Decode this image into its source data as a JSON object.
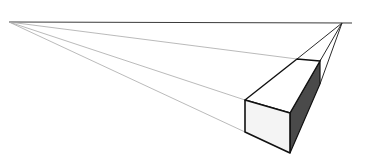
{
  "diagram": {
    "background": "#ffffff",
    "colors": {
      "horizon": "#3a3a3a",
      "guide_light": "#a8a8a8",
      "guide_dark": "#2a2a2a",
      "edge": "#111111",
      "front_face": "#f4f4f4",
      "top_face": "#ffffff",
      "side_face": "#4a4a4a"
    },
    "horizon_line": {
      "x1": 9,
      "y1": 22,
      "x2": 352,
      "y2": 23
    },
    "vanishing_points": [
      {
        "name": "left",
        "x": 9,
        "y": 22
      },
      {
        "name": "right",
        "x": 342,
        "y": 23
      }
    ],
    "box": {
      "front_top_left": {
        "x": 245,
        "y": 100
      },
      "front_bottom_left": {
        "x": 245,
        "y": 132
      },
      "near_top": {
        "x": 290,
        "y": 113
      },
      "near_bottom": {
        "x": 290,
        "y": 153
      },
      "back_top_left": {
        "x": 297,
        "y": 59
      },
      "back_top_right": {
        "x": 320,
        "y": 61
      },
      "back_bottom_right": {
        "x": 320,
        "y": 84
      }
    }
  }
}
